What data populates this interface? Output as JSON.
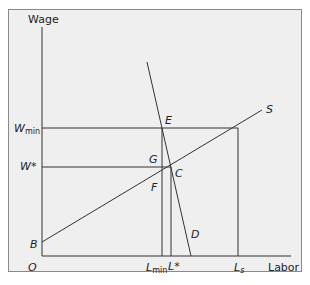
{
  "diagram": {
    "type": "economics-minimum-wage-monopsony",
    "axes": {
      "y_label": "Wage",
      "x_label": "Labor",
      "origin_label": "O"
    },
    "wage_levels": [
      {
        "id": "wmin",
        "label": "W",
        "subscript": "min",
        "y": 128
      },
      {
        "id": "wstar",
        "label": "W*",
        "subscript": "",
        "y": 167
      }
    ],
    "labor_levels": [
      {
        "id": "lmin",
        "label": "L",
        "subscript": "min",
        "x": 162
      },
      {
        "id": "lstar",
        "label": "L*",
        "subscript": "",
        "x": 171
      },
      {
        "id": "ls",
        "label": "L",
        "subscript": "s",
        "x": 238
      }
    ],
    "curves": [
      {
        "id": "supply",
        "label": "S",
        "from": [
          42,
          242
        ],
        "to": [
          262,
          110
        ]
      },
      {
        "id": "demand",
        "label": "D",
        "from": [
          147,
          62
        ],
        "to": [
          191,
          256
        ]
      }
    ],
    "points": [
      {
        "label": "E",
        "x": 165,
        "y": 124
      },
      {
        "label": "G",
        "x": 147,
        "y": 164
      },
      {
        "label": "C",
        "x": 175,
        "y": 175
      },
      {
        "label": "F",
        "x": 151,
        "y": 189
      },
      {
        "label": "B",
        "x": 30,
        "y": 247
      },
      {
        "label": "D",
        "x": 190,
        "y": 237
      },
      {
        "label": "S",
        "x": 267,
        "y": 112
      }
    ],
    "colors": {
      "background": "#efefef",
      "frame_border": "#8a8a8a",
      "lines": "#333333",
      "text": "#222222"
    }
  }
}
